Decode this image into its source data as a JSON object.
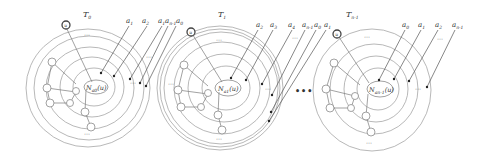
{
  "figure": {
    "panels": [
      {
        "id": "T0",
        "title": "T",
        "title_sub": "0",
        "root_label": "u",
        "center_label": "N",
        "center_sub": "a0",
        "center_arg": "(u)",
        "arrow_labels": [
          {
            "base": "a",
            "sub": "1"
          },
          {
            "base": "a",
            "sub": "2"
          },
          {
            "base": "a",
            "sub": "1"
          },
          {
            "base": "a",
            "sub": "n-1"
          },
          {
            "base": "a",
            "sub": "0"
          }
        ],
        "ellipsis": "⋯"
      },
      {
        "id": "T1",
        "title": "T",
        "title_sub": "1",
        "root_label": "u",
        "center_label": "N",
        "center_sub": "a1",
        "center_arg": "(u)",
        "arrow_labels": [
          {
            "base": "a",
            "sub": "2"
          },
          {
            "base": "a",
            "sub": "3"
          },
          {
            "base": "a",
            "sub": "4"
          },
          {
            "base": "a",
            "sub": "n-1"
          },
          {
            "base": "a",
            "sub": "0"
          },
          {
            "base": "a",
            "sub": "1"
          }
        ],
        "ellipsis": "⋯"
      },
      {
        "id": "Tn-1",
        "title": "T",
        "title_sub": "n-1",
        "root_label": "u",
        "center_label": "N",
        "center_sub": "an-1",
        "center_arg": "(u)",
        "arrow_labels": [
          {
            "base": "a",
            "sub": "0"
          },
          {
            "base": "a",
            "sub": "1"
          },
          {
            "base": "a",
            "sub": "2"
          },
          {
            "base": "a",
            "sub": "n-1"
          }
        ],
        "ellipsis": "⋯"
      }
    ],
    "between_ellipsis": "•••"
  }
}
